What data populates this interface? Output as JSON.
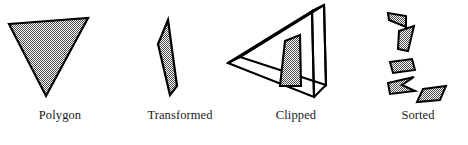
{
  "figure": {
    "background_color": "#ffffff",
    "outline_color": "#000000",
    "fill_pattern": "checkerboard-dither-50",
    "fill_color_light": "#ffffff",
    "fill_color_dark": "#4d4d4d",
    "fill_apparent_gray": "#a8a8a8"
  },
  "panels": [
    {
      "id": "polygon",
      "label": "Polygon",
      "description": "Downward pointing filled triangle",
      "shape_type": "triangle",
      "shapes": [
        {
          "name": "source-polygon",
          "points": "9,24 88,18 46,96"
        }
      ]
    },
    {
      "id": "transformed",
      "label": "Transformed",
      "description": "Narrow sliver quadrilateral after perspective transform",
      "shape_type": "sliver-quad",
      "shapes": [
        {
          "name": "transformed-polygon",
          "points": "48,20 57,86 50,95 38,44"
        }
      ]
    },
    {
      "id": "clipped",
      "label": "Clipped",
      "description": "Wireframe view frustum box with the clipped polygon fragment inside",
      "shape_type": "frustum-wireframe",
      "shapes": [
        {
          "name": "clipped-polygon",
          "points": "57,41 72,35 73,86 52,86"
        }
      ],
      "frustum": {
        "apex": "0,63",
        "near_top": "84,11",
        "near_bottom": "86,97",
        "far_top": "95,17",
        "far_bottom": "96,91",
        "offset_x": 12,
        "offset_y": -6
      }
    },
    {
      "id": "sorted",
      "label": "Sorted",
      "description": "Five separated polygon fragments ordered by depth",
      "shape_type": "fragments",
      "shapes": [
        {
          "name": "fragment-1",
          "points": "20,13 38,16 38,27 21,20"
        },
        {
          "name": "fragment-2",
          "points": "31,31 46,26 40,51 30,49"
        },
        {
          "name": "fragment-3",
          "points": "22,62 44,59 47,70 25,73"
        },
        {
          "name": "fragment-4",
          "points": "20,83 46,77 34,85 47,91 22,94"
        },
        {
          "name": "fragment-5",
          "points": "55,89 78,86 72,100 49,102"
        }
      ]
    }
  ]
}
